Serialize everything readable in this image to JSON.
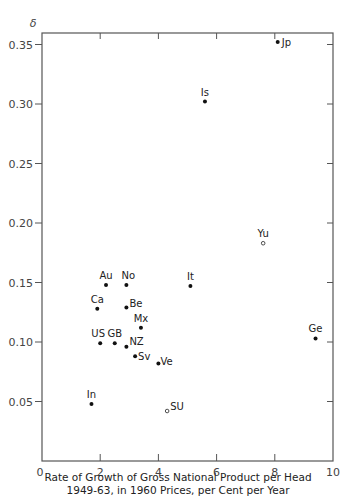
{
  "chart_data": {
    "type": "scatter",
    "title": "",
    "xlabel": "Rate of Growth of Gross National Product per Head 1949-63, in 1960 Prices, per Cent per Year",
    "xlabel_lines": [
      "Rate of Growth of Gross National Product per Head",
      "1949-63, in 1960 Prices, per Cent per Year"
    ],
    "ylabel": "δ",
    "xlim": [
      0,
      10
    ],
    "ylim": [
      0,
      0.36
    ],
    "x_ticks": [
      "0",
      "2",
      "4",
      "6",
      "8",
      "10"
    ],
    "y_ticks": [
      "0.05",
      "0.10",
      "0.15",
      "0.20",
      "0.25",
      "0.30",
      "0.35"
    ],
    "grid": false,
    "legend": null,
    "points": [
      {
        "label": "Jp",
        "x": 8.1,
        "y": 0.352,
        "marker": "filled"
      },
      {
        "label": "Is",
        "x": 5.6,
        "y": 0.302,
        "marker": "filled"
      },
      {
        "label": "Yu",
        "x": 7.6,
        "y": 0.183,
        "marker": "hollow"
      },
      {
        "label": "It",
        "x": 5.1,
        "y": 0.147,
        "marker": "filled"
      },
      {
        "label": "Au",
        "x": 2.2,
        "y": 0.148,
        "marker": "filled"
      },
      {
        "label": "No",
        "x": 2.9,
        "y": 0.148,
        "marker": "filled"
      },
      {
        "label": "Ca",
        "x": 1.9,
        "y": 0.128,
        "marker": "filled"
      },
      {
        "label": "Be",
        "x": 2.9,
        "y": 0.129,
        "marker": "filled"
      },
      {
        "label": "Mx",
        "x": 3.4,
        "y": 0.112,
        "marker": "filled"
      },
      {
        "label": "US",
        "x": 2.0,
        "y": 0.099,
        "marker": "filled"
      },
      {
        "label": "GB",
        "x": 2.5,
        "y": 0.099,
        "marker": "filled"
      },
      {
        "label": "NZ",
        "x": 2.9,
        "y": 0.096,
        "marker": "filled"
      },
      {
        "label": "Sv",
        "x": 3.2,
        "y": 0.088,
        "marker": "filled"
      },
      {
        "label": "Ve",
        "x": 4.0,
        "y": 0.082,
        "marker": "filled"
      },
      {
        "label": "Ge",
        "x": 9.4,
        "y": 0.103,
        "marker": "filled"
      },
      {
        "label": "In",
        "x": 1.7,
        "y": 0.048,
        "marker": "filled"
      },
      {
        "label": "SU",
        "x": 4.3,
        "y": 0.042,
        "marker": "hollow"
      }
    ]
  }
}
